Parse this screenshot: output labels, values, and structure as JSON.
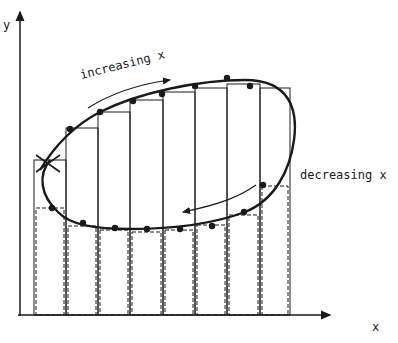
{
  "figure": {
    "axes": {
      "x_label": "x",
      "y_label": "y"
    },
    "annotations": {
      "increasing": "increasing x",
      "decreasing": "decreasing x"
    },
    "caption": "",
    "colors": {
      "ink": "#1a1a1a",
      "background": "#ffffff"
    },
    "bars": {
      "edges": [
        34,
        66,
        98,
        130,
        163,
        195,
        227,
        260,
        290
      ],
      "upper_tops": [
        160,
        128,
        112,
        100,
        92,
        88,
        84,
        88
      ],
      "lower_tops": [
        208,
        226,
        230,
        232,
        230,
        225,
        215,
        186
      ],
      "baseline": 315
    },
    "curve_points": {
      "upper": [
        [
          70,
          129
        ],
        [
          100,
          112
        ],
        [
          133,
          101
        ],
        [
          162,
          94
        ],
        [
          195,
          86
        ],
        [
          227,
          78
        ],
        [
          250,
          86
        ]
      ],
      "lower": [
        [
          52,
          208
        ],
        [
          83,
          223
        ],
        [
          115,
          228
        ],
        [
          147,
          229
        ],
        [
          180,
          229
        ],
        [
          212,
          226
        ],
        [
          244,
          212
        ],
        [
          263,
          185
        ]
      ],
      "crossing": [
        50,
        163
      ]
    }
  }
}
